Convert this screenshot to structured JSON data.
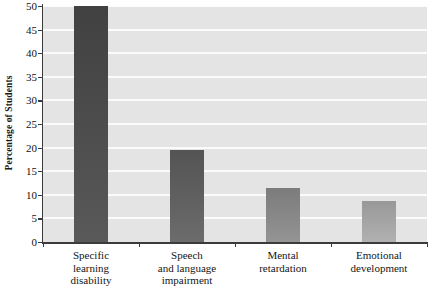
{
  "chart_data": {
    "type": "bar",
    "title": "",
    "xlabel": "",
    "ylabel": "Percentage of Students",
    "ylim": [
      0,
      50
    ],
    "ytick_step": 5,
    "yticks": [
      "0",
      "5",
      "10",
      "15",
      "20",
      "25",
      "30",
      "35",
      "40",
      "45",
      "50"
    ],
    "grid": true,
    "legend": false,
    "categories": [
      "Specific learning disability",
      "Speech and language impairment",
      "Mental retardation",
      "Emotional development"
    ],
    "category_lines": [
      [
        "Specific",
        "learning",
        "disability"
      ],
      [
        "Speech",
        "and language",
        "impairment"
      ],
      [
        "Mental",
        "retardation"
      ],
      [
        "Emotional",
        "development"
      ]
    ],
    "values": [
      50.0,
      19.5,
      11.5,
      8.7
    ],
    "bar_colors": [
      "#4b4b4b",
      "#5e5e5e",
      "#868686",
      "#a3a3a3"
    ],
    "plot_background": "#e4e4e4",
    "gridline_color": "#fbfbfb",
    "axis_color": "#3b3b3b"
  }
}
